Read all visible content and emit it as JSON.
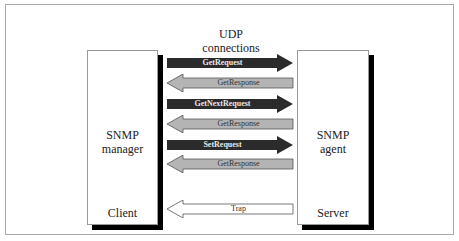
{
  "diagram": {
    "title_lines": [
      "UDP",
      "connections"
    ],
    "manager": {
      "line1": "SNMP",
      "line2": "manager",
      "role": "Client"
    },
    "agent": {
      "line1": "SNMP",
      "line2": "agent",
      "role": "Server"
    },
    "messages": [
      {
        "label": "GetRequest",
        "direction": "right",
        "style": "dark"
      },
      {
        "label": "GetResponse",
        "direction": "left",
        "style": "light"
      },
      {
        "label": "GetNextRequest",
        "direction": "right",
        "style": "dark"
      },
      {
        "label": "GetResponse",
        "direction": "left",
        "style": "light"
      },
      {
        "label": "SetRequest",
        "direction": "right",
        "style": "dark"
      },
      {
        "label": "GetResponse",
        "direction": "left",
        "style": "light"
      },
      {
        "label": "Trap",
        "direction": "left",
        "style": "white"
      }
    ],
    "colors": {
      "dark_arrow": "#2b2b2b",
      "light_arrow": "#b4b4b4",
      "white_arrow": "#ffffff",
      "shadow": "#000000",
      "frame": "#a8a8a8"
    }
  }
}
